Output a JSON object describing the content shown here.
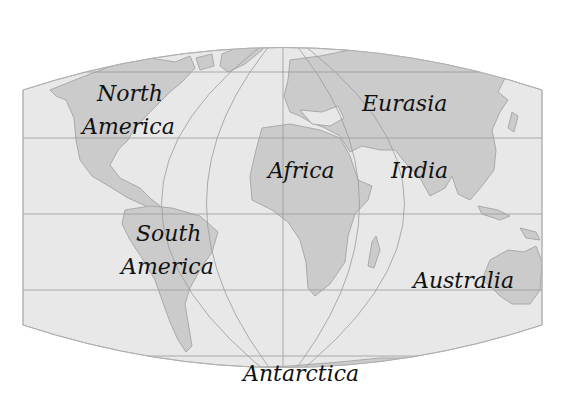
{
  "map": {
    "type": "world-map",
    "projection": "pseudo-cylindrical (curved top/bottom, straight sides)",
    "colors": {
      "background": "#ffffff",
      "ocean": "#e8e8e8",
      "land": "#cbcbcb",
      "land_outline": "#a9a9a9",
      "graticule": "#9a9a9a",
      "label": "#111111"
    },
    "labels": [
      {
        "id": "north-america",
        "lines": [
          "North",
          "America"
        ]
      },
      {
        "id": "south-america",
        "lines": [
          "South",
          "America"
        ]
      },
      {
        "id": "africa",
        "lines": [
          "Africa"
        ]
      },
      {
        "id": "eurasia",
        "lines": [
          "Eurasia"
        ]
      },
      {
        "id": "india",
        "lines": [
          "India"
        ]
      },
      {
        "id": "australia",
        "lines": [
          "Australia"
        ]
      },
      {
        "id": "antarctica",
        "lines": [
          "Antarctica"
        ]
      }
    ]
  }
}
